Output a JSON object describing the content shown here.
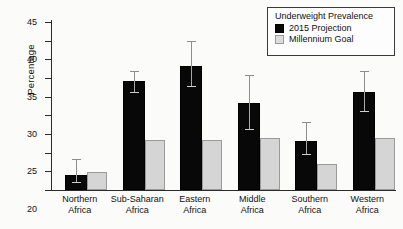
{
  "chart_data": {
    "type": "bar",
    "title": "",
    "xlabel": "",
    "ylabel": "Percentage",
    "ylim": [
      0,
      45
    ],
    "ytick_step": 5,
    "yticks": [
      0,
      5,
      10,
      15,
      20,
      25,
      30,
      35,
      40,
      45
    ],
    "grid": false,
    "legend_position": "top-right",
    "legend_title": "Underweight Prevalence",
    "categories": [
      "Northern\nAfrica",
      "Sub-Saharan\nAfrica",
      "Eastern\nAfrica",
      "Middle\nAfrica",
      "Southern\nAfrica",
      "Western\nAfrica"
    ],
    "category_lines": [
      [
        "Northern",
        "Africa"
      ],
      [
        "Sub-Saharan",
        "Africa"
      ],
      [
        "Eastern",
        "Africa"
      ],
      [
        "Middle",
        "Africa"
      ],
      [
        "Southern",
        "Africa"
      ],
      [
        "Western",
        "Africa"
      ]
    ],
    "series": [
      {
        "name": "2015 Projection",
        "color": "#080808",
        "values": [
          4.1,
          29.1,
          33.2,
          23.4,
          13.1,
          26.2
        ],
        "errors_low": [
          2.0,
          25.9,
          27.5,
          16.2,
          9.3,
          21.0
        ],
        "errors_high": [
          8.4,
          31.9,
          39.8,
          30.9,
          18.3,
          31.9
        ]
      },
      {
        "name": "Millennium Goal",
        "color": "#d5d5d5",
        "values": [
          4.8,
          13.4,
          13.4,
          13.8,
          7.0,
          13.8
        ],
        "errors_low": [
          null,
          null,
          null,
          null,
          null,
          null
        ],
        "errors_high": [
          null,
          null,
          null,
          null,
          null,
          null
        ]
      }
    ]
  },
  "legend": {
    "title": "Underweight Prevalence",
    "entries": [
      {
        "label": "2015 Projection",
        "swatch": "dark"
      },
      {
        "label": "Millennium Goal",
        "swatch": "light"
      }
    ]
  },
  "axis": {
    "y_title": "Percentage"
  }
}
